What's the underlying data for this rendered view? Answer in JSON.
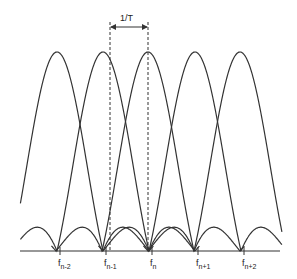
{
  "diagram": {
    "title": "",
    "period_label": "1/T",
    "colors": {
      "line": "#333333",
      "background": "#ffffff"
    },
    "peaks_x": [
      57,
      103,
      148,
      195,
      240
    ],
    "peak_top_y": 52,
    "baseline_y": 251,
    "baseline_x_range": [
      20,
      280
    ],
    "dashed_lines_x": [
      110,
      148
    ],
    "labels": [
      {
        "base": "f",
        "sub": "n-2",
        "x": 58
      },
      {
        "base": "f",
        "sub": "n-1",
        "x": 104
      },
      {
        "base": "f",
        "sub": "n",
        "x": 150
      },
      {
        "base": "f",
        "sub": "n+1",
        "x": 196
      },
      {
        "base": "f",
        "sub": "n+2",
        "x": 242
      }
    ]
  }
}
